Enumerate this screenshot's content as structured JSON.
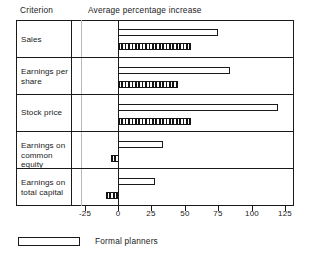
{
  "header": {
    "criterion_label": "Criterion",
    "value_axis_title": "Average percentage increase"
  },
  "legend": {
    "items": [
      {
        "label": "Formal planners",
        "style": "open-outline",
        "swatch_color": "#ffffff"
      }
    ]
  },
  "axis": {
    "tick_labels": [
      "-25",
      "0",
      "25",
      "50",
      "75",
      "100",
      "125"
    ],
    "min": -25,
    "max": 125
  },
  "rows": [
    {
      "label": "Sales",
      "open_value": 75,
      "hatch_value": 55
    },
    {
      "label": "Earnings per\nshare",
      "open_value": 84,
      "hatch_value": 45
    },
    {
      "label": "Stock price",
      "open_value": 120,
      "hatch_value": 55
    },
    {
      "label": "Earnings on\ncommon equity",
      "open_value": 34,
      "hatch_value": -5
    },
    {
      "label": "Earnings on\ntotal capital",
      "open_value": 28,
      "hatch_value": -9
    }
  ],
  "row_labels": [
    "Sales",
    "Earnings per share",
    "Stock price",
    "Earnings on common equity",
    "Earnings on total capital"
  ],
  "chart_data": {
    "type": "bar",
    "orientation": "horizontal",
    "title": "",
    "xlabel": "Average percentage increase",
    "ylabel": "Criterion",
    "xlim": [
      -25,
      125
    ],
    "xticks": [
      -25,
      0,
      25,
      50,
      75,
      100,
      125
    ],
    "grid": false,
    "legend_position": "bottom-left",
    "categories": [
      "Sales",
      "Earnings per share",
      "Stock price",
      "Earnings on common equity",
      "Earnings on total capital"
    ],
    "series": [
      {
        "name": "Formal planners",
        "style": "open-outline",
        "values": [
          75,
          84,
          120,
          34,
          28
        ]
      },
      {
        "name": "",
        "style": "hatched",
        "values": [
          55,
          45,
          55,
          -5,
          -9
        ]
      }
    ],
    "annotations": [
      "Criterion",
      "Average percentage increase"
    ]
  }
}
